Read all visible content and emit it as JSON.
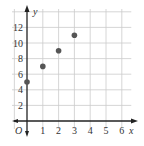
{
  "chart_data": {
    "type": "scatter",
    "title": "",
    "xlabel": "x",
    "ylabel": "y",
    "origin_label": "O",
    "x": [
      0,
      1,
      2,
      3
    ],
    "y": [
      5,
      7,
      9,
      11
    ],
    "points": [
      {
        "x": 0,
        "y": 5
      },
      {
        "x": 1,
        "y": 7
      },
      {
        "x": 2,
        "y": 9
      },
      {
        "x": 3,
        "y": 11
      }
    ],
    "x_ticks": [
      "1",
      "2",
      "3",
      "4",
      "5",
      "6"
    ],
    "y_ticks": [
      "2",
      "4",
      "6",
      "8",
      "10",
      "12"
    ],
    "xlim": [
      0,
      6.5
    ],
    "ylim": [
      -1,
      14
    ],
    "grid": true,
    "legend": null,
    "colors": {
      "point": "#555555",
      "grid": "#cccccc",
      "axis": "#222222"
    }
  }
}
